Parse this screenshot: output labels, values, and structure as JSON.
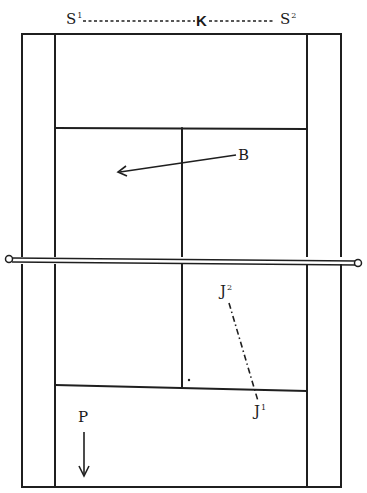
{
  "diagram": {
    "type": "tennis-court",
    "ink_color": "#1f1f1f",
    "background": "#ffffff",
    "labels": {
      "s1": {
        "text": "S",
        "sup": "1"
      },
      "k": {
        "text": "K"
      },
      "s2": {
        "text": "S",
        "sup": "2"
      },
      "b": {
        "text": "B"
      },
      "j2": {
        "text": "J",
        "sup": "2"
      },
      "j1": {
        "text": "J",
        "sup": "1"
      },
      "p": {
        "text": "P"
      }
    },
    "elements": [
      "baseline-top",
      "baseline-bottom",
      "doubles-sideline-left",
      "doubles-sideline-right",
      "singles-sideline-left",
      "singles-sideline-right",
      "service-line-top",
      "service-line-bottom",
      "center-service-line",
      "net",
      "arrow-b",
      "dash-dot-path-j1-j2",
      "arrow-p",
      "dotted-line-s1-k-s2"
    ]
  }
}
